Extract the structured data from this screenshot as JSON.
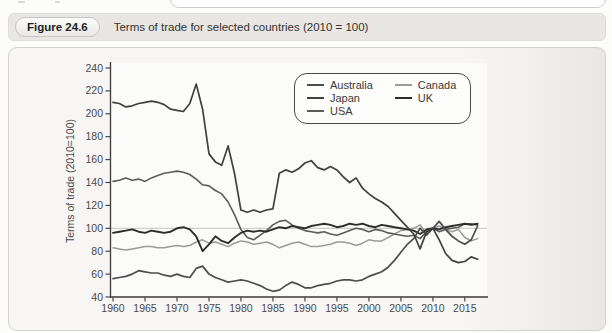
{
  "page": {
    "figure_label": "Figure 24.6",
    "figure_title": "Terms of trade for selected countries (2010 = 100)"
  },
  "colors": {
    "panel_bg": "#f7f6f4",
    "plot_bg": "#fbfbfa",
    "header_bg": "#e8e7e4",
    "axis": "#3a3a3a",
    "gridline": "#c6c5c2",
    "tick_text": "#4a4a4a"
  },
  "chart_data": {
    "type": "line",
    "title": "Terms of trade for selected countries (2010 = 100)",
    "xlabel": "",
    "ylabel": "Terms of trade (2010=100)",
    "x_start": 1960,
    "x_end": 2017,
    "x_ticks": [
      1960,
      1965,
      1970,
      1975,
      1980,
      1985,
      1990,
      1995,
      2000,
      2005,
      2010,
      2015
    ],
    "ylim": [
      40,
      240
    ],
    "y_ticks": [
      40,
      60,
      80,
      100,
      120,
      140,
      160,
      180,
      200,
      220,
      240
    ],
    "reference_line_y": 100,
    "grid": "horizontal line at 100 only",
    "legend_position": "top-center-inside",
    "legend_order": [
      "Australia",
      "Canada",
      "Japan",
      "UK",
      "USA"
    ],
    "series": [
      {
        "name": "Canada",
        "color": "#9c9b99",
        "width": 1.5,
        "values": [
          83,
          82,
          81,
          82,
          83,
          84,
          84,
          83,
          83,
          84,
          85,
          84,
          85,
          88,
          90,
          87,
          88,
          86,
          84,
          87,
          89,
          88,
          86,
          87,
          88,
          86,
          83,
          85,
          87,
          88,
          86,
          84,
          84,
          85,
          86,
          88,
          88,
          87,
          85,
          87,
          90,
          89,
          89,
          92,
          95,
          98,
          99,
          100,
          103,
          95,
          100,
          102,
          99,
          97,
          99,
          92,
          89,
          91
        ]
      },
      {
        "name": "USA",
        "color": "#5c5c5c",
        "width": 1.6,
        "values": [
          141,
          142,
          144,
          142,
          143,
          141,
          144,
          146,
          148,
          149,
          150,
          149,
          147,
          143,
          138,
          137,
          133,
          130,
          123,
          112,
          99,
          92,
          90,
          94,
          98,
          103,
          106,
          107,
          103,
          100,
          98,
          97,
          96,
          97,
          95,
          94,
          96,
          98,
          100,
          99,
          97,
          99,
          98,
          96,
          95,
          94,
          93,
          94,
          91,
          97,
          100,
          97,
          99,
          100,
          101,
          104,
          104,
          103
        ]
      },
      {
        "name": "UK",
        "color": "#2d2d2d",
        "width": 1.9,
        "values": [
          96,
          97,
          98,
          99,
          97,
          96,
          98,
          97,
          96,
          97,
          100,
          101,
          99,
          93,
          80,
          86,
          93,
          89,
          87,
          92,
          96,
          98,
          97,
          98,
          97,
          99,
          101,
          100,
          102,
          101,
          100,
          102,
          103,
          104,
          103,
          101,
          102,
          104,
          103,
          104,
          102,
          101,
          103,
          102,
          101,
          100,
          99,
          98,
          95,
          99,
          100,
          99,
          101,
          102,
          103,
          104,
          103,
          104
        ]
      },
      {
        "name": "Australia",
        "color": "#4e4e4e",
        "width": 1.7,
        "values": [
          56,
          57,
          58,
          60,
          63,
          62,
          61,
          61,
          59,
          58,
          60,
          58,
          57,
          65,
          67,
          60,
          57,
          55,
          53,
          54,
          55,
          54,
          52,
          50,
          47,
          45,
          46,
          50,
          53,
          51,
          48,
          48,
          50,
          51,
          52,
          54,
          55,
          55,
          54,
          55,
          58,
          60,
          62,
          66,
          72,
          79,
          86,
          91,
          100,
          94,
          100,
          106,
          99,
          93,
          89,
          86,
          90,
          102
        ]
      },
      {
        "name": "Japan",
        "color": "#404040",
        "width": 1.7,
        "values": [
          210,
          209,
          206,
          207,
          209,
          210,
          211,
          210,
          208,
          204,
          203,
          202,
          209,
          226,
          204,
          165,
          158,
          155,
          172,
          148,
          116,
          114,
          116,
          114,
          116,
          117,
          148,
          151,
          149,
          152,
          157,
          159,
          153,
          151,
          154,
          151,
          145,
          140,
          144,
          135,
          130,
          126,
          123,
          119,
          113,
          107,
          101,
          95,
          82,
          97,
          100,
          90,
          78,
          72,
          70,
          71,
          75,
          73
        ]
      }
    ]
  }
}
